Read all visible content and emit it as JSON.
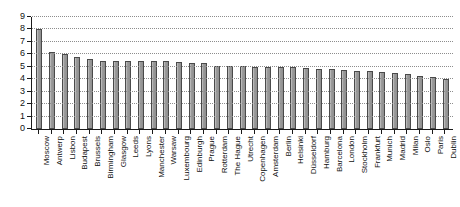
{
  "chart_data": {
    "type": "bar",
    "title": "",
    "subtitle": "",
    "xlabel": "",
    "ylabel": "",
    "ylim": [
      0,
      9
    ],
    "y_ticks": [
      0,
      1,
      2,
      3,
      4,
      5,
      6,
      7,
      8,
      9
    ],
    "y_tick_labels": [
      "0",
      "1",
      "2",
      "3",
      "4",
      "5",
      "6",
      "7",
      "8",
      "9"
    ],
    "grid": "horizontal-dotted",
    "legend": "none",
    "bar_color": "#9a9a9a",
    "bar_edge_color": "#4a4a4a",
    "axis_color": "#1a1a1a",
    "grid_color": "#8d8d8d",
    "categories": [
      "Moscow",
      "Antwerp",
      "Lisbon",
      "Budapest",
      "Brussels",
      "Birmingham",
      "Glasgow",
      "Leeds",
      "Lyons",
      "Manchester",
      "Warsaw",
      "Luxembourg",
      "Edinburgh",
      "Prague",
      "Rotterdam",
      "The Hague",
      "Utrecht",
      "Copenhagen",
      "Amsterdam",
      "Berlin",
      "Helsinki",
      "Düsseldorf",
      "Hamburg",
      "Barcelona",
      "London",
      "Stockholm",
      "Frankfurt",
      "Munich",
      "Madrid",
      "Milan",
      "Oslo",
      "Paris",
      "Dublin"
    ],
    "values": [
      8.0,
      6.2,
      6.0,
      5.75,
      5.65,
      5.5,
      5.5,
      5.5,
      5.5,
      5.5,
      5.5,
      5.35,
      5.3,
      5.3,
      5.1,
      5.1,
      5.05,
      5.0,
      5.0,
      5.0,
      4.95,
      4.9,
      4.85,
      4.8,
      4.75,
      4.7,
      4.65,
      4.6,
      4.5,
      4.4,
      4.25,
      4.2,
      4.05
    ]
  }
}
